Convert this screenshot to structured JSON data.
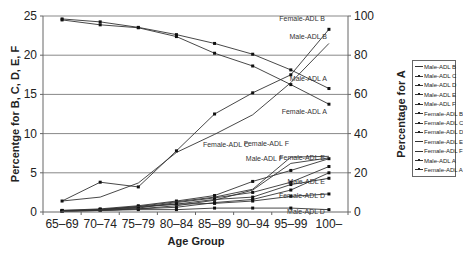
{
  "chart_data": {
    "type": "line",
    "title": "",
    "xlabel": "Age Group",
    "ylabel": "Percentge for B, C, D, E, F",
    "y2label": "Percentage for A",
    "categories": [
      "65–69",
      "70–74",
      "75–79",
      "80–84",
      "85–89",
      "90–94",
      "95–99",
      "100–"
    ],
    "ylim": [
      0,
      25
    ],
    "y2lim": [
      0,
      100
    ],
    "yticks": [
      0,
      5,
      10,
      15,
      20,
      25
    ],
    "y2ticks": [
      0,
      20,
      40,
      60,
      80,
      100
    ],
    "grid": true,
    "legend_position": "right",
    "series": [
      {
        "name": "Male-ADL B",
        "axis": "left",
        "values": [
          1.4,
          1.9,
          3.7,
          7.6,
          9.9,
          12.4,
          16.5,
          21.5
        ],
        "label": "Male-ADL B"
      },
      {
        "name": "Male-ADL C",
        "axis": "left",
        "values": [
          0.1,
          0.2,
          0.4,
          0.6,
          1.2,
          1.6,
          2.8,
          5.0
        ],
        "label": ""
      },
      {
        "name": "Male-ADL D",
        "axis": "left",
        "values": [
          0.1,
          0.2,
          0.3,
          0.3,
          0.5,
          0.5,
          0.5,
          0.3
        ],
        "label": "Male-ADL D"
      },
      {
        "name": "Male-ADL E",
        "axis": "left",
        "values": [
          0.2,
          0.3,
          0.7,
          1.0,
          1.6,
          1.9,
          3.5,
          4.3
        ],
        "label": "Male-ADL E"
      },
      {
        "name": "Male-ADL F",
        "axis": "left",
        "values": [
          0.1,
          0.3,
          0.5,
          1.2,
          1.8,
          2.5,
          3.8,
          5.8
        ],
        "label": "Male-ADL F"
      },
      {
        "name": "Female-ADL B",
        "axis": "left",
        "values": [
          1.4,
          3.8,
          3.2,
          7.8,
          12.5,
          15.2,
          17.5,
          23.3
        ],
        "label": "Female-ADL B"
      },
      {
        "name": "Female-ADL C",
        "axis": "left",
        "values": [
          0.2,
          0.4,
          0.8,
          1.4,
          2.1,
          3.9,
          5.3,
          6.8
        ],
        "label": "Female-ADL C"
      },
      {
        "name": "Female-ADL D",
        "axis": "left",
        "values": [
          0.1,
          0.3,
          0.6,
          1.0,
          1.1,
          1.4,
          2.0,
          2.3
        ],
        "label": "Female-ADL D"
      },
      {
        "name": "Female-ADL E",
        "axis": "left",
        "values": [
          0.1,
          0.2,
          0.4,
          0.8,
          1.5,
          2.8,
          6.2,
          6.9
        ],
        "label": "Female-ADL E"
      },
      {
        "name": "Female-ADL F",
        "axis": "left",
        "values": [
          0.1,
          0.3,
          0.7,
          1.3,
          1.9,
          2.9,
          7.0,
          7.1
        ],
        "label": "Female-ADL F"
      },
      {
        "name": "Male-ADL A",
        "axis": "right",
        "values": [
          98.5,
          97.0,
          94.2,
          90.5,
          86.0,
          80.5,
          72.5,
          63.0
        ],
        "label": "Male-ADL A"
      },
      {
        "name": "Female-ADL A",
        "axis": "right",
        "values": [
          98.0,
          95.5,
          94.0,
          89.5,
          81.0,
          74.5,
          65.0,
          55.0
        ],
        "label": "Female-ADL A"
      }
    ]
  },
  "legend": {
    "items": [
      "Male-ADL B",
      "Male-ADL C",
      "Male-ADL D",
      "Male-ADL E",
      "Male-ADL F",
      "Female-ADL B",
      "Female-ADL C",
      "Female-ADL D",
      "Female-ADL E",
      "Female-ADL F",
      "Male-ADL A",
      "Female-ADL A"
    ]
  }
}
